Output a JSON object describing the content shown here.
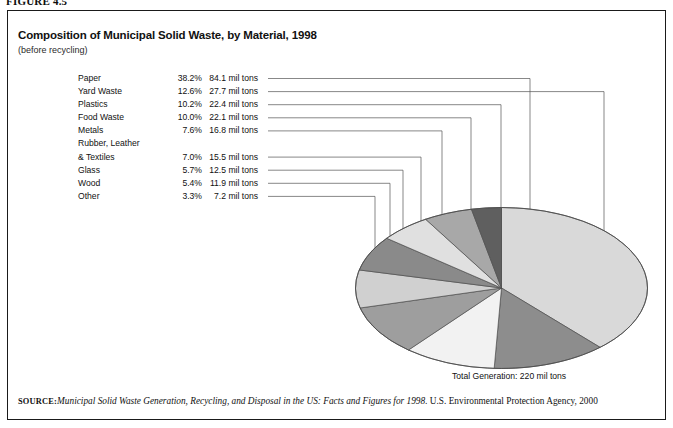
{
  "figure": {
    "number_label": "FIGURE 4.5",
    "title": "Composition of Municipal Solid Waste, by Material, 1998",
    "subtitle": "(before recycling)",
    "total_generation": "Total Generation: 220 mil tons"
  },
  "source": {
    "label": "SOURCE:",
    "italic_part": "Municipal Solid Waste Generation, Recycling, and Disposal in the US: Facts and Figures for 1998.",
    "plain_part": " U.S. Environmental Protection Agency, 2000"
  },
  "legend": {
    "rows": [
      {
        "label": "Paper",
        "percent": "38.2%",
        "amount": "84.1 mil tons",
        "indent": false
      },
      {
        "label": "Yard Waste",
        "percent": "12.6%",
        "amount": "27.7 mil tons",
        "indent": false
      },
      {
        "label": "Plastics",
        "percent": "10.2%",
        "amount": "22.4 mil tons",
        "indent": false
      },
      {
        "label": "Food Waste",
        "percent": "10.0%",
        "amount": "22.1 mil tons",
        "indent": false
      },
      {
        "label": "Metals",
        "percent": "7.6%",
        "amount": "16.8 mil tons",
        "indent": false
      },
      {
        "label": "Rubber, Leather",
        "percent": "",
        "amount": "",
        "indent": false
      },
      {
        "label": "& Textiles",
        "percent": "7.0%",
        "amount": "15.5 mil tons",
        "indent": true
      },
      {
        "label": "Glass",
        "percent": "5.7%",
        "amount": "12.5 mil tons",
        "indent": false
      },
      {
        "label": "Wood",
        "percent": "5.4%",
        "amount": "11.9 mil tons",
        "indent": false
      },
      {
        "label": "Other",
        "percent": "3.3%",
        "amount": "7.2 mil tons",
        "indent": false
      }
    ]
  },
  "chart_data": {
    "type": "pie",
    "title": "Composition of Municipal Solid Waste, by Material, 1998",
    "subtitle": "(before recycling)",
    "unit": "mil tons",
    "total": 220,
    "total_label": "Total Generation: 220 mil tons",
    "legend_position": "left",
    "grid": false,
    "categories": [
      "Paper",
      "Yard Waste",
      "Plastics",
      "Food Waste",
      "Metals",
      "Rubber, Leather & Textiles",
      "Glass",
      "Wood",
      "Other"
    ],
    "values": [
      84.1,
      27.7,
      22.4,
      22.1,
      16.8,
      15.5,
      12.5,
      11.9,
      7.2
    ],
    "percents": [
      38.2,
      12.6,
      10.2,
      10.0,
      7.6,
      7.0,
      5.7,
      5.4,
      3.3
    ],
    "colors": [
      "#d9d9d9",
      "#8d8d8d",
      "#f2f2f2",
      "#9e9e9e",
      "#d0d0d0",
      "#8a8a8a",
      "#e0e0e0",
      "#a8a8a8",
      "#5f5f5f"
    ],
    "start_angle_deg": -90,
    "direction": "clockwise"
  },
  "style": {
    "frame_color": "#1a1a1a",
    "leader_color": "#555555",
    "pie_outline": "#4d4d4d",
    "background": "#ffffff"
  }
}
